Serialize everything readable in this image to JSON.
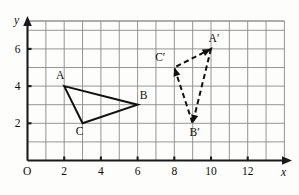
{
  "figure": {
    "axis_labels": {
      "x": "x",
      "y": "y"
    },
    "origin_label": "O",
    "x_ticks": [
      {
        "value": 2,
        "label": "2"
      },
      {
        "value": 4,
        "label": "4"
      },
      {
        "value": 6,
        "label": "6"
      },
      {
        "value": 8,
        "label": "8"
      },
      {
        "value": 10,
        "label": "10"
      },
      {
        "value": 12,
        "label": "12"
      }
    ],
    "y_ticks": [
      {
        "value": 2,
        "label": "2"
      },
      {
        "value": 4,
        "label": "4"
      },
      {
        "value": 6,
        "label": "6"
      }
    ],
    "colors": {
      "grid": "#8a8a8a",
      "axis": "#1a1a1a",
      "shape": "#111111",
      "background": "#fdfdfc"
    }
  },
  "chart_data": {
    "type": "scatter",
    "title": "",
    "xlabel": "x",
    "ylabel": "y",
    "xlim": [
      0,
      14
    ],
    "ylim": [
      0,
      7.5
    ],
    "grid": true,
    "grid_spacing": 1,
    "legend": "none",
    "series": [
      {
        "name": "Triangle ABC",
        "style": "solid",
        "closed": true,
        "points": [
          {
            "label": "A",
            "x": 2,
            "y": 4,
            "label_dx": -4,
            "label_dy": -7
          },
          {
            "label": "B",
            "x": 6,
            "y": 3,
            "label_dx": 6,
            "label_dy": -6
          },
          {
            "label": "C",
            "x": 3,
            "y": 2,
            "label_dx": -3,
            "label_dy": 12
          }
        ]
      },
      {
        "name": "Triangle A'B'C'",
        "style": "dashed",
        "closed": true,
        "arrowheads": true,
        "points": [
          {
            "label": "A′",
            "x": 10,
            "y": 6,
            "label_dx": 3,
            "label_dy": -7
          },
          {
            "label": "B′",
            "x": 9,
            "y": 2,
            "label_dx": 2,
            "label_dy": 13
          },
          {
            "label": "C′",
            "x": 8,
            "y": 5,
            "label_dx": -14,
            "label_dy": -7
          }
        ]
      }
    ]
  }
}
